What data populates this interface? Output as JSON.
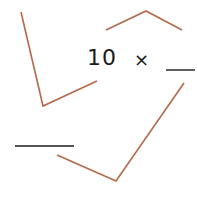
{
  "expression": {
    "operand": "10",
    "operator": "×"
  },
  "blanks": [
    {
      "id": "multiplier-blank",
      "x1": 166,
      "y1": 70,
      "x2": 195,
      "y2": 70
    },
    {
      "id": "product-blank",
      "x1": 15,
      "y1": 146,
      "x2": 74,
      "y2": 146
    }
  ],
  "arrows": [
    {
      "id": "left-arc",
      "points": "21,12 43,106 97,81"
    },
    {
      "id": "top-arc",
      "points": "106,30 146,11 182,30"
    },
    {
      "id": "right-arc",
      "points": "184,83 116,181 57,155"
    }
  ],
  "colors": {
    "arc": "#b5694a",
    "text": "#1a1a1a",
    "blank": "#1a1a1a"
  }
}
